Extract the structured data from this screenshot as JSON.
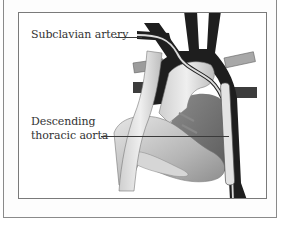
{
  "figure": {
    "labels": {
      "subclavian": "Subclavian artery",
      "descending_line1": "Descending",
      "descending_line2": "thoracic aorta"
    },
    "colors": {
      "frame": "#7a7a7a",
      "vessel_dark": "#1e1e1e",
      "vessel_light": "#d9d9d9",
      "heart_mid": "#9a9a9a",
      "text": "#333333"
    }
  }
}
